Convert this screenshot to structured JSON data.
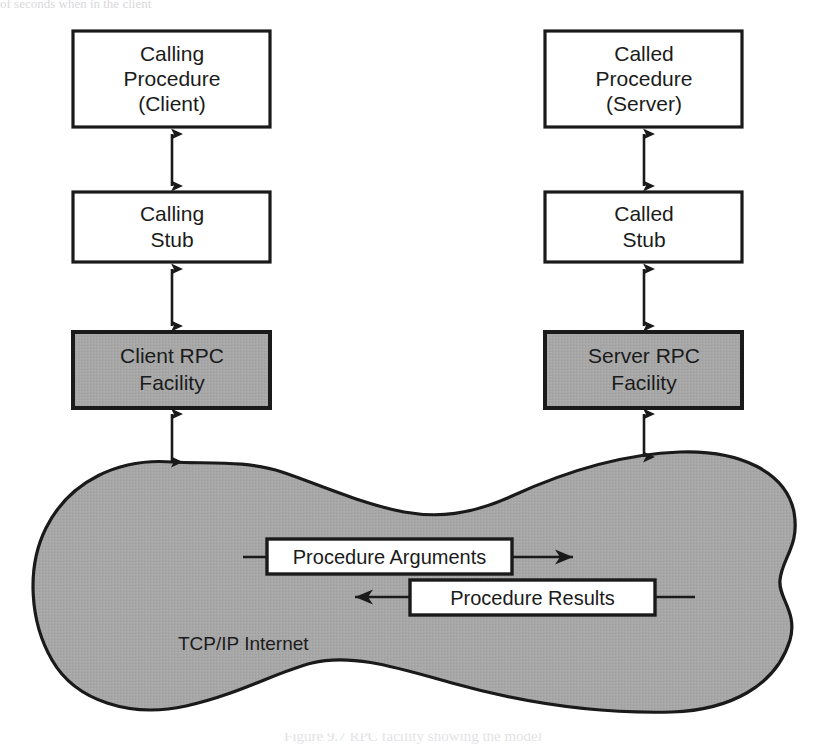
{
  "page": {
    "background_color": "#ffffff",
    "cut_off_header_text": "of seconds when in the client",
    "caption": "Figure 9.7  RPC facility showing the model"
  },
  "colors": {
    "box_fill": "#ffffff",
    "box_stroke": "#1a1a1a",
    "rpc_fill": "#a8a8a8",
    "network_fill": "#a6a6a6",
    "network_stroke": "#1a1a1a",
    "text": "#1b1b1b"
  },
  "diagram": {
    "type": "block-diagram",
    "columns": [
      {
        "id": "client",
        "side": "left",
        "boxes": [
          {
            "id": "calling-procedure",
            "label": "Calling\nProcedure\n(Client)",
            "lines": [
              "Calling",
              "Procedure",
              "(Client)"
            ],
            "style": "plain"
          },
          {
            "id": "calling-stub",
            "label": "Calling\nStub",
            "lines": [
              "Calling",
              "Stub"
            ],
            "style": "plain"
          },
          {
            "id": "client-rpc-facility",
            "label": "Client RPC\nFacility",
            "lines": [
              "Client RPC",
              "Facility"
            ],
            "style": "shaded"
          }
        ]
      },
      {
        "id": "server",
        "side": "right",
        "boxes": [
          {
            "id": "called-procedure",
            "label": "Called\nProcedure\n(Server)",
            "lines": [
              "Called",
              "Procedure",
              "(Server)"
            ],
            "style": "plain"
          },
          {
            "id": "called-stub",
            "label": "Called\nStub",
            "lines": [
              "Called",
              "Stub"
            ],
            "style": "plain"
          },
          {
            "id": "server-rpc-facility",
            "label": "Server RPC\nFacility",
            "lines": [
              "Server RPC",
              "Facility"
            ],
            "style": "shaded"
          }
        ]
      }
    ],
    "network": {
      "id": "tcp-ip-internet",
      "label": "TCP/IP Internet",
      "shape": "cloud-blob",
      "fill": "#a6a6a6"
    },
    "messages": [
      {
        "id": "procedure-arguments",
        "label": "Procedure Arguments",
        "direction": "left-to-right"
      },
      {
        "id": "procedure-results",
        "label": "Procedure Results",
        "direction": "right-to-left"
      }
    ],
    "connectors": [
      {
        "id": "client-proc-to-stub",
        "from": "calling-procedure",
        "to": "calling-stub",
        "arrow": "double"
      },
      {
        "id": "client-stub-to-rpc",
        "from": "calling-stub",
        "to": "client-rpc-facility",
        "arrow": "double"
      },
      {
        "id": "client-rpc-to-network",
        "from": "client-rpc-facility",
        "to": "tcp-ip-internet",
        "arrow": "double"
      },
      {
        "id": "server-proc-to-stub",
        "from": "called-procedure",
        "to": "called-stub",
        "arrow": "double"
      },
      {
        "id": "server-stub-to-rpc",
        "from": "called-stub",
        "to": "server-rpc-facility",
        "arrow": "double"
      },
      {
        "id": "server-rpc-to-network",
        "from": "server-rpc-facility",
        "to": "tcp-ip-internet",
        "arrow": "double"
      }
    ]
  }
}
